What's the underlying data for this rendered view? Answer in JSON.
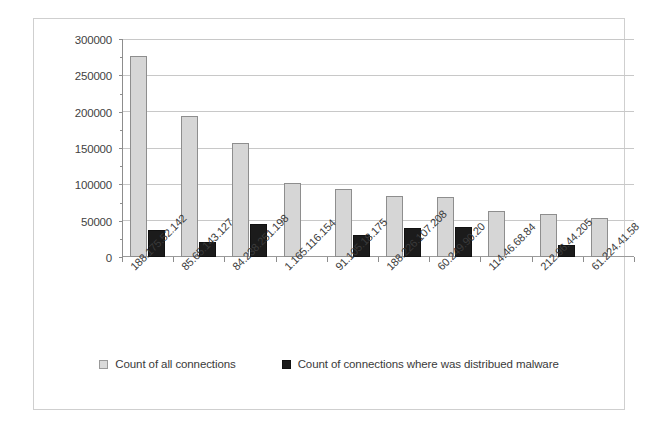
{
  "chart_data": {
    "type": "bar",
    "title": "",
    "subtitle": "",
    "xlabel": "",
    "ylabel": "",
    "ylim": [
      0,
      300000
    ],
    "ytick_step": 50000,
    "yticks": [
      "0",
      "50000",
      "100000",
      "150000",
      "200000",
      "250000",
      "300000"
    ],
    "grid": true,
    "legend_position": "bottom",
    "categories": [
      "188.175.52.142",
      "85.65.143.127",
      "84.238.251.198",
      "1.165.116.154",
      "91.105.18.175",
      "188.226.107.208",
      "60.249.90.20",
      "114.46.68.84",
      "212.96.44.205",
      "61.224.41.58"
    ],
    "series": [
      {
        "name": "Count of all connections",
        "color": "#d6d6d6",
        "values": [
          278000,
          195000,
          158000,
          102000,
          94000,
          84000,
          83000,
          64000,
          60000,
          54000
        ]
      },
      {
        "name": "Count of connections where was distribued malware",
        "color": "#1b1b1b",
        "values": [
          37000,
          21000,
          45000,
          0,
          30000,
          40000,
          41000,
          0,
          16000,
          0
        ]
      }
    ]
  },
  "legend": {
    "items": [
      {
        "label": "Count of all connections"
      },
      {
        "label": "Count of connections where was distribued malware"
      }
    ]
  }
}
